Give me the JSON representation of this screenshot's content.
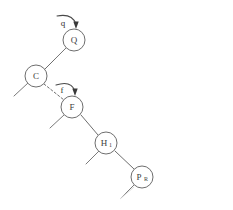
{
  "figure": {
    "background_color": "#ffffff",
    "stroke_color": "#6e6e6e",
    "label_color": "#3c3c3c",
    "arrow_color": "#3a3a3a"
  },
  "nodes": [
    {
      "id": "Q",
      "label": "Q",
      "subscript": "",
      "cx": 74,
      "cy": 40,
      "r": 11
    },
    {
      "id": "C",
      "label": "C",
      "subscript": "",
      "cx": 36,
      "cy": 76,
      "r": 11
    },
    {
      "id": "F",
      "label": "F",
      "subscript": "",
      "cx": 72,
      "cy": 107,
      "r": 11
    },
    {
      "id": "H",
      "label": "H",
      "subscript": "1",
      "cx": 106,
      "cy": 143,
      "r": 11
    },
    {
      "id": "P",
      "label": "P",
      "subscript": "R",
      "cx": 142,
      "cy": 177,
      "r": 11
    }
  ],
  "edges": [
    {
      "id": "edge-c-q",
      "from": "C",
      "to": "Q",
      "style": "solid",
      "x1": 45,
      "y1": 69,
      "x2": 66,
      "y2": 48
    },
    {
      "id": "edge-c-f",
      "from": "C",
      "to": "F",
      "style": "dashed",
      "x1": 44,
      "y1": 84,
      "x2": 64,
      "y2": 100
    },
    {
      "id": "edge-f-h",
      "from": "F",
      "to": "H",
      "style": "solid",
      "x1": 81,
      "y1": 115,
      "x2": 98,
      "y2": 135
    },
    {
      "id": "edge-h-p",
      "from": "H",
      "to": "P",
      "style": "solid",
      "x1": 115,
      "y1": 151,
      "x2": 134,
      "y2": 169
    }
  ],
  "stubs": [
    {
      "id": "stub-q-left",
      "owner": "Q",
      "x1": 66,
      "y1": 48,
      "x2": 55,
      "y2": 59
    },
    {
      "id": "stub-c-left",
      "owner": "C",
      "x1": 28,
      "y1": 83,
      "x2": 14,
      "y2": 96
    },
    {
      "id": "stub-f-left",
      "owner": "F",
      "x1": 64,
      "y1": 115,
      "x2": 50,
      "y2": 128
    },
    {
      "id": "stub-h-left",
      "owner": "H",
      "x1": 99,
      "y1": 151,
      "x2": 86,
      "y2": 164
    },
    {
      "id": "stub-p-left",
      "owner": "P",
      "x1": 134,
      "y1": 185,
      "x2": 121,
      "y2": 198
    }
  ],
  "arrows": [
    {
      "id": "arrow-q",
      "label": "q",
      "target_node": "Q",
      "label_x": 63,
      "label_y": 23,
      "curve": "M 57 16 Q 72 13 76 24",
      "head_x": 76,
      "head_y": 28
    },
    {
      "id": "arrow-f",
      "label": "f",
      "target_node": "F",
      "label_x": 62,
      "label_y": 90,
      "curve": "M 56 85 Q 71 80 75 91",
      "head_x": 75,
      "head_y": 95
    }
  ]
}
